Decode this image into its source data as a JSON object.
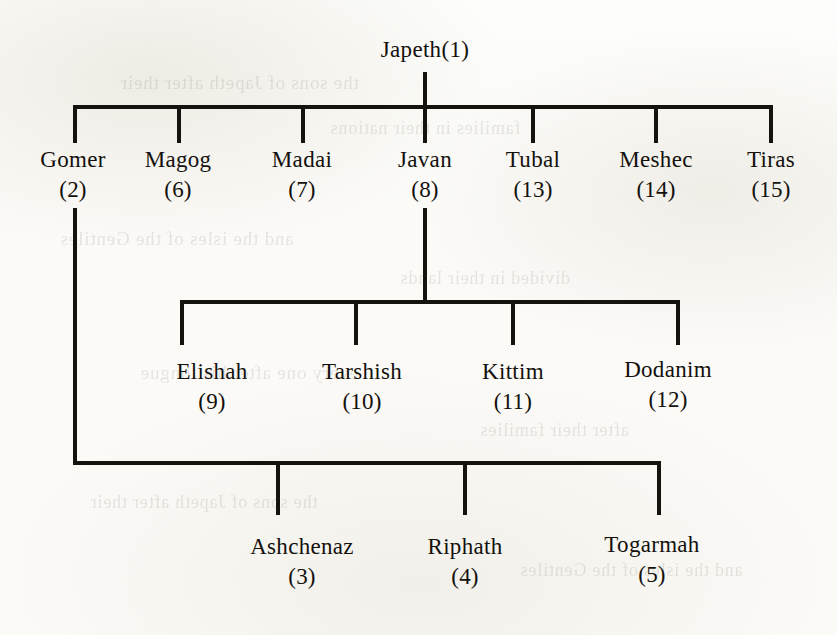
{
  "chart_title": "Japeth Genealogy",
  "colors": {
    "ink": "#16130f",
    "paper": "#fdfdfb",
    "bleed": "#3d3a33"
  },
  "root": {
    "name": "Japeth",
    "index": "(1)",
    "label": "Japeth(1)"
  },
  "generation1": {
    "nodes": [
      {
        "name": "Gomer",
        "index": "(2)"
      },
      {
        "name": "Magog",
        "index": "(6)"
      },
      {
        "name": "Madai",
        "index": "(7)"
      },
      {
        "name": "Javan",
        "index": "(8)"
      },
      {
        "name": "Tubal",
        "index": "(13)"
      },
      {
        "name": "Meshec",
        "index": "(14)"
      },
      {
        "name": "Tiras",
        "index": "(15)"
      }
    ]
  },
  "javan_children": {
    "parent": "Javan",
    "nodes": [
      {
        "name": "Elishah",
        "index": "(9)"
      },
      {
        "name": "Tarshish",
        "index": "(10)"
      },
      {
        "name": "Kittim",
        "index": "(11)"
      },
      {
        "name": "Dodanim",
        "index": "(12)"
      }
    ]
  },
  "gomer_children": {
    "parent": "Gomer",
    "nodes": [
      {
        "name": "Ashchenaz",
        "index": "(3)"
      },
      {
        "name": "Riphath",
        "index": "(4)"
      },
      {
        "name": "Togarmah",
        "index": "(5)"
      }
    ]
  },
  "background_bleed": {
    "lines": [
      "the sons of Japeth after their",
      "families in their nations",
      "and the isles of the Gentiles",
      "divided in their lands",
      "every one after his tongue",
      "after their families"
    ]
  }
}
